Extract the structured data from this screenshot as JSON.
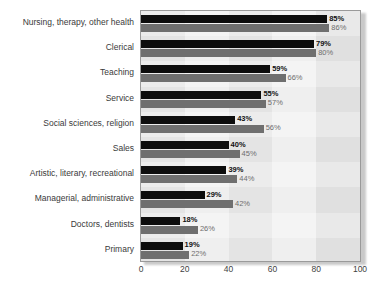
{
  "chart_data": {
    "type": "bar",
    "orientation": "horizontal",
    "title": "",
    "xlabel": "",
    "ylabel": "",
    "xlim": [
      0,
      100
    ],
    "xticks": [
      0,
      20,
      40,
      60,
      80,
      100
    ],
    "grid": false,
    "legend_position": "inside-bottom-right",
    "categories": [
      "Nursing, therapy, other health",
      "Clerical",
      "Teaching",
      "Service",
      "Social sciences, religion",
      "Sales",
      "Artistic, literary, recreational",
      "Managerial, administrative",
      "Doctors, dentists",
      "Primary"
    ],
    "series": [
      {
        "name": "1982",
        "color": "#0d0d0d",
        "values": [
          85,
          79,
          59,
          55,
          43,
          40,
          39,
          29,
          18,
          19
        ],
        "labels": [
          "85%",
          "79%",
          "59%",
          "55%",
          "43%",
          "40%",
          "39%",
          "29%",
          "18%",
          "19%"
        ]
      },
      {
        "name": "1993",
        "color": "#6f6f6f",
        "values": [
          86,
          80,
          66,
          57,
          56,
          45,
          44,
          42,
          26,
          22
        ],
        "labels": [
          "86%",
          "80%",
          "66%",
          "57%",
          "56%",
          "45%",
          "44%",
          "42%",
          "26%",
          "22%"
        ]
      }
    ]
  },
  "axis": {
    "tick_labels": [
      "0",
      "20",
      "40",
      "60",
      "80",
      "100"
    ]
  },
  "legend": {
    "items": [
      {
        "label": "1982",
        "color": "#0d0d0d"
      },
      {
        "label": "1993",
        "color": "#6f6f6f"
      }
    ]
  }
}
